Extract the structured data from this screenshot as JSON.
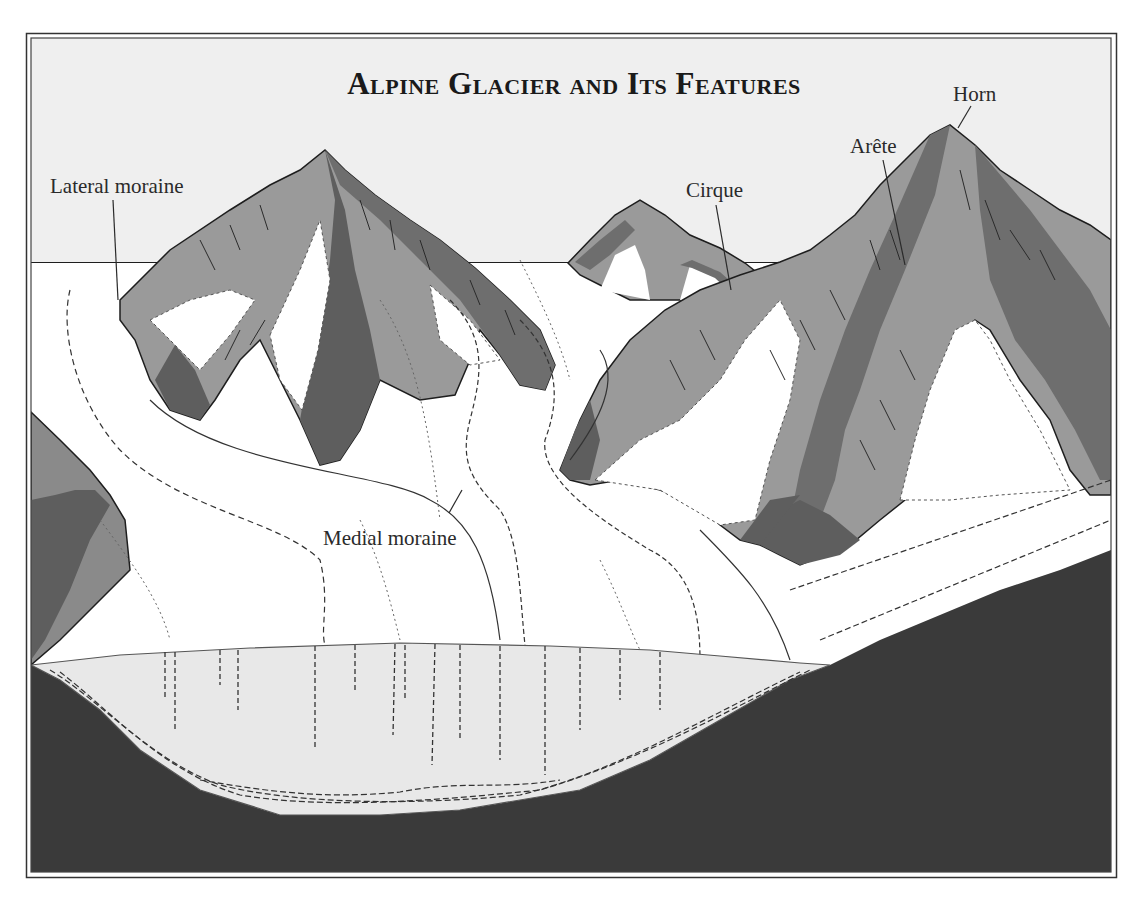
{
  "figure": {
    "title": "Alpine Glacier and Its Features",
    "labels": {
      "lateral_moraine": "Lateral moraine",
      "medial_moraine": "Medial moraine",
      "cirque": "Cirque",
      "arete": "Arête",
      "horn": "Horn"
    },
    "colors": {
      "sky": "#efefef",
      "ice": "#ffffff",
      "rock_light": "#9a9a9a",
      "rock_mid": "#7c7c7c",
      "rock_dark": "#5e5e5e",
      "bedrock": "#3a3a3a",
      "ice_section": "#e8e8e8",
      "ink": "#1e1e1e"
    }
  }
}
